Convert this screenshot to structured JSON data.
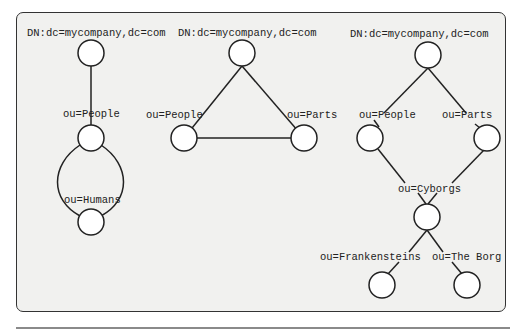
{
  "colors": {
    "background": "#f1f1ef",
    "stroke": "#222222",
    "node_fill": "#ffffff",
    "frame_border": "#333333"
  },
  "diagrams": [
    {
      "name": "cycle",
      "nodes": [
        {
          "id": "root",
          "label": "DN:dc=mycompany,dc=com"
        },
        {
          "id": "people",
          "label": "ou=People"
        },
        {
          "id": "humans",
          "label": "ou=Humans"
        }
      ],
      "edges": [
        [
          "root",
          "people"
        ],
        [
          "people",
          "humans",
          "arc-left"
        ],
        [
          "people",
          "humans",
          "arc-right"
        ]
      ]
    },
    {
      "name": "triangle",
      "nodes": [
        {
          "id": "root",
          "label": "DN:dc=mycompany,dc=com"
        },
        {
          "id": "people",
          "label": "ou=People"
        },
        {
          "id": "parts",
          "label": "ou=Parts"
        }
      ],
      "edges": [
        [
          "root",
          "people"
        ],
        [
          "root",
          "parts"
        ],
        [
          "people",
          "parts"
        ]
      ]
    },
    {
      "name": "dag",
      "nodes": [
        {
          "id": "root",
          "label": "DN:dc=mycompany,dc=com"
        },
        {
          "id": "people",
          "label": "ou=People"
        },
        {
          "id": "parts",
          "label": "ou=Parts"
        },
        {
          "id": "cyborgs",
          "label": "ou=Cyborgs"
        },
        {
          "id": "frankensteins",
          "label": "ou=Frankensteins"
        },
        {
          "id": "borg",
          "label": "ou=The Borg"
        }
      ],
      "edges": [
        [
          "root",
          "people"
        ],
        [
          "root",
          "parts"
        ],
        [
          "people",
          "cyborgs"
        ],
        [
          "parts",
          "cyborgs"
        ],
        [
          "cyborgs",
          "frankensteins"
        ],
        [
          "cyborgs",
          "borg"
        ]
      ]
    }
  ]
}
